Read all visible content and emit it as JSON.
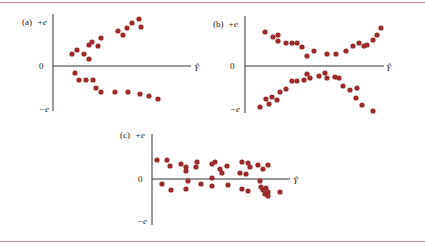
{
  "figure": {
    "border_color": "#c98a8f",
    "dot_color": "#9b2a2a",
    "axis_color": "#333333"
  },
  "chart_data": [
    {
      "type": "scatter",
      "panel": "(a)",
      "title": "(a)",
      "xlabel": "Ŷ",
      "ylabel_top": "+e",
      "ylabel_zero": "0",
      "ylabel_bottom": "−e",
      "description": "Residuals fan out: two diverging bands (upper rising, lower falling) as Ŷ increases",
      "points_px": [
        [
          72,
          54
        ],
        [
          77,
          50
        ],
        [
          84,
          54
        ],
        [
          89,
          59
        ],
        [
          89,
          45
        ],
        [
          92,
          42
        ],
        [
          98,
          46
        ],
        [
          101,
          38
        ],
        [
          118,
          31
        ],
        [
          123,
          35
        ],
        [
          127,
          28
        ],
        [
          132,
          23
        ],
        [
          139,
          19
        ],
        [
          141,
          27
        ],
        [
          75,
          73
        ],
        [
          79,
          80
        ],
        [
          86,
          80
        ],
        [
          93,
          80
        ],
        [
          96,
          88
        ],
        [
          101,
          92
        ],
        [
          115,
          92
        ],
        [
          128,
          92
        ],
        [
          140,
          94
        ],
        [
          149,
          96
        ],
        [
          158,
          99
        ]
      ]
    },
    {
      "type": "scatter",
      "panel": "(b)",
      "title": "(b)",
      "xlabel": "Ŷ",
      "ylabel_top": "+e",
      "ylabel_zero": "0",
      "ylabel_bottom": "−e",
      "description": "Residuals form an X pattern: bands converge toward zero mid-range and diverge at both ends",
      "points_px": [
        [
          265,
          32
        ],
        [
          273,
          37
        ],
        [
          278,
          35
        ],
        [
          278,
          41
        ],
        [
          286,
          43
        ],
        [
          292,
          43
        ],
        [
          297,
          43
        ],
        [
          302,
          47
        ],
        [
          307,
          56
        ],
        [
          314,
          51
        ],
        [
          327,
          54
        ],
        [
          336,
          54
        ],
        [
          346,
          51
        ],
        [
          353,
          46
        ],
        [
          359,
          43
        ],
        [
          364,
          46
        ],
        [
          367,
          45
        ],
        [
          373,
          40
        ],
        [
          377,
          35
        ],
        [
          381,
          28
        ],
        [
          260,
          107
        ],
        [
          266,
          99
        ],
        [
          269,
          104
        ],
        [
          272,
          97
        ],
        [
          277,
          100
        ],
        [
          280,
          92
        ],
        [
          286,
          89
        ],
        [
          292,
          81
        ],
        [
          297,
          81
        ],
        [
          304,
          80
        ],
        [
          307,
          74
        ],
        [
          310,
          78
        ],
        [
          319,
          76
        ],
        [
          325,
          73
        ],
        [
          327,
          78
        ],
        [
          335,
          77
        ],
        [
          339,
          78
        ],
        [
          343,
          86
        ],
        [
          350,
          90
        ],
        [
          357,
          88
        ],
        [
          356,
          98
        ],
        [
          362,
          105
        ],
        [
          373,
          111
        ]
      ]
    },
    {
      "type": "scatter",
      "panel": "(c)",
      "title": "(c)",
      "xlabel": "Ŷ",
      "ylabel_top": "+e",
      "ylabel_zero": "0",
      "ylabel_bottom": "−e",
      "description": "Residuals randomly scattered in a constant-width horizontal band around zero",
      "points_px": [
        [
          157,
          160
        ],
        [
          167,
          160
        ],
        [
          170,
          166
        ],
        [
          181,
          164
        ],
        [
          186,
          167
        ],
        [
          186,
          171
        ],
        [
          196,
          167
        ],
        [
          197,
          162
        ],
        [
          212,
          164
        ],
        [
          215,
          162
        ],
        [
          220,
          169
        ],
        [
          222,
          173
        ],
        [
          227,
          166
        ],
        [
          242,
          162
        ],
        [
          240,
          173
        ],
        [
          246,
          174
        ],
        [
          248,
          163
        ],
        [
          250,
          167
        ],
        [
          258,
          165
        ],
        [
          263,
          169
        ],
        [
          268,
          165
        ],
        [
          162,
          184
        ],
        [
          171,
          190
        ],
        [
          186,
          189
        ],
        [
          188,
          181
        ],
        [
          201,
          184
        ],
        [
          212,
          178
        ],
        [
          212,
          186
        ],
        [
          228,
          185
        ],
        [
          242,
          189
        ],
        [
          248,
          191
        ],
        [
          260,
          181
        ],
        [
          261,
          187
        ],
        [
          263,
          190
        ],
        [
          265,
          194
        ],
        [
          266,
          188
        ],
        [
          268,
          192
        ],
        [
          268,
          196
        ],
        [
          280,
          192
        ]
      ]
    }
  ],
  "panels": {
    "a": {
      "tag": "(a)",
      "top": "+e",
      "zero": "0",
      "bottom": "−e",
      "xlabel": "Ŷ"
    },
    "b": {
      "tag": "(b)",
      "top": "+e",
      "zero": "0",
      "bottom": "−e",
      "xlabel": "Ŷ"
    },
    "c": {
      "tag": "(c)",
      "top": "+e",
      "zero": "0",
      "bottom": "−e",
      "xlabel": "Ŷ"
    }
  }
}
